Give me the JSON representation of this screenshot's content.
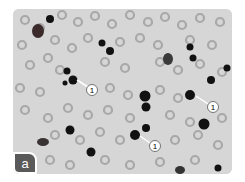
{
  "figure": {
    "panel_label": "a",
    "annotations": [
      {
        "text": "1",
        "cx": 92,
        "cy": 90,
        "from": [
          77,
          80
        ]
      },
      {
        "text": "1",
        "cx": 213,
        "cy": 107,
        "from": [
          196,
          96
        ]
      },
      {
        "text": "1",
        "cx": 155,
        "cy": 146,
        "from": [
          140,
          136
        ]
      }
    ],
    "colors": {
      "background": "#d8d8d8",
      "rbc": "#a9a9a9",
      "dark_cell": "#111111",
      "badge": "#5a5a5a"
    }
  }
}
